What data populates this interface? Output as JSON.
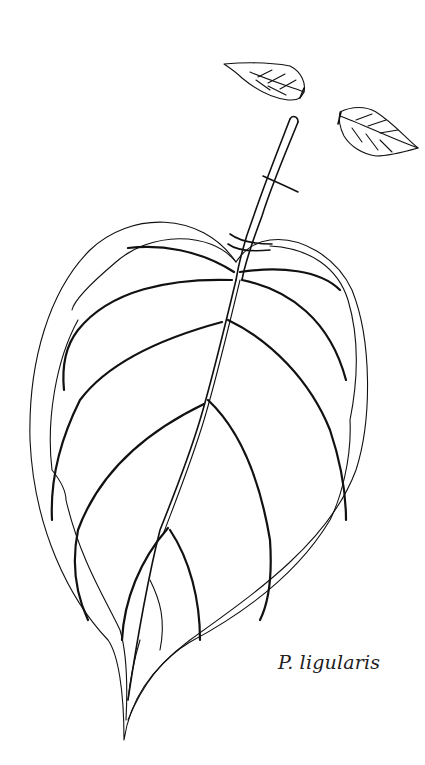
{
  "figure": {
    "caption": "P. ligularis",
    "stroke_color": "#111111",
    "background": "#ffffff"
  }
}
